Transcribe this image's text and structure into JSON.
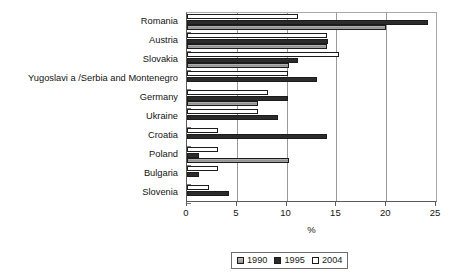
{
  "chart_data": {
    "type": "bar",
    "orientation": "horizontal",
    "title": "",
    "subtitle": "",
    "xlabel": "%",
    "ylabel": "",
    "xlim": [
      0,
      25
    ],
    "xticks": [
      0,
      5,
      10,
      15,
      20,
      25
    ],
    "xtick_labels": [
      "0",
      "5",
      "10",
      "15",
      "20",
      "25"
    ],
    "grid": true,
    "grid_axis": "x",
    "legend_position": "bottom-center",
    "categories": [
      "Romania",
      "Austria",
      "Slovakia",
      "Yugoslavi a /Serbia and Montenegro",
      "Germany",
      "Ukraine",
      "Croatia",
      "Poland",
      "Bulgaria",
      "Slovenia"
    ],
    "series": [
      {
        "name": "1990",
        "color": "#9d9d9d",
        "values": [
          20.0,
          14.1,
          10.2,
          0,
          7.1,
          0,
          0,
          10.2,
          0,
          0
        ]
      },
      {
        "name": "1995",
        "color": "#2b2b2b",
        "values": [
          24.2,
          14.2,
          11.1,
          13.1,
          10.1,
          9.1,
          14.1,
          1.2,
          1.2,
          4.2
        ]
      },
      {
        "name": "2004",
        "color": "#ffffff",
        "values": [
          11.1,
          14.1,
          15.3,
          10.1,
          8.1,
          7.1,
          3.1,
          3.1,
          3.1,
          2.2
        ]
      }
    ],
    "series_draw_order_top_to_bottom": [
      "2004",
      "1995",
      "1990"
    ]
  },
  "legend": {
    "items": [
      {
        "label": "1990",
        "swatch": "gray-swatch"
      },
      {
        "label": "1995",
        "swatch": "black-swatch"
      },
      {
        "label": "2004",
        "swatch": "white-swatch"
      }
    ]
  },
  "axis": {
    "x_title": "%"
  },
  "colors": {
    "series_1990": "#9d9d9d",
    "series_1995": "#2b2b2b",
    "series_2004": "#ffffff",
    "axis": "#5a5a5a",
    "grid": "#9a9a9a",
    "text": "#141414"
  }
}
